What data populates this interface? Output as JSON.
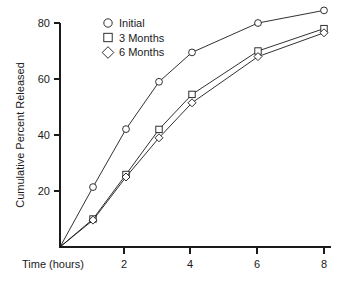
{
  "chart_data": {
    "type": "line",
    "title": "",
    "xlabel": "Time (hours)",
    "ylabel": "Cumulative Percent Released",
    "x": [
      0,
      1,
      2,
      3,
      4,
      6,
      8
    ],
    "xlim": [
      0,
      8
    ],
    "ylim": [
      0,
      86
    ],
    "xticks": [
      2,
      4,
      6,
      8
    ],
    "xtick_labels": [
      "2",
      "4",
      "6",
      "8"
    ],
    "yticks": [
      20,
      40,
      60,
      80
    ],
    "ytick_labels": [
      "20",
      "40",
      "60",
      "80"
    ],
    "grid": false,
    "legend_position": "top-left-inside",
    "series": [
      {
        "name": "Initial",
        "marker": "circle",
        "values": [
          0,
          21.4,
          42.1,
          59.0,
          69.5,
          80.0,
          84.5
        ]
      },
      {
        "name": "3 Months",
        "marker": "square",
        "values": [
          0,
          10.0,
          25.9,
          42.0,
          54.5,
          70.0,
          78.0
        ]
      },
      {
        "name": "6 Months",
        "marker": "diamond",
        "values": [
          0,
          9.6,
          25.0,
          39.0,
          51.5,
          68.0,
          76.5
        ]
      }
    ]
  },
  "axis": {
    "x_title": "Time (hours)",
    "y_title": "Cumulative Percent Released",
    "x_tick_2": "2",
    "x_tick_4": "4",
    "x_tick_6": "6",
    "x_tick_8": "8",
    "y_tick_20": "20",
    "y_tick_40": "40",
    "y_tick_60": "60",
    "y_tick_80": "80"
  },
  "legend": {
    "entries": [
      {
        "label": "Initial",
        "marker": "circle"
      },
      {
        "label": "3 Months",
        "marker": "square"
      },
      {
        "label": "6 Months",
        "marker": "diamond"
      }
    ],
    "item_0_label": "Initial",
    "item_1_label": "3 Months",
    "item_2_label": "6 Months"
  },
  "colors": {
    "ink": "#1a1a1a",
    "background": "#ffffff",
    "marker_fill": "#ffffff"
  }
}
